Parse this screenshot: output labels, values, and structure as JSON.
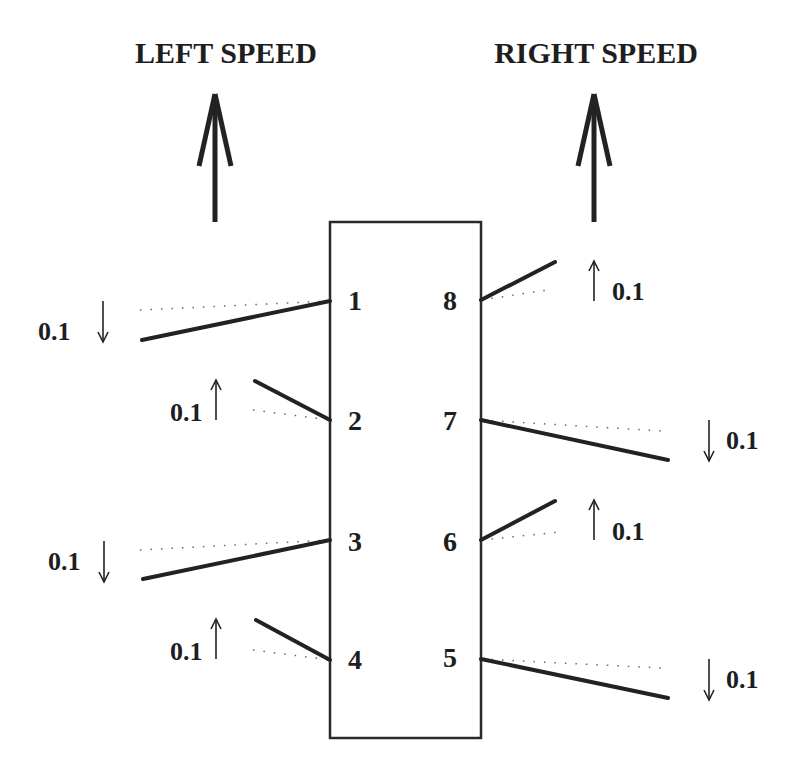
{
  "titles": {
    "left": "LEFT SPEED",
    "right": "RIGHT SPEED"
  },
  "sensors": [
    {
      "id": "1",
      "side": "left",
      "change": "0.1",
      "direction": "down"
    },
    {
      "id": "2",
      "side": "left",
      "change": "0.1",
      "direction": "up"
    },
    {
      "id": "3",
      "side": "left",
      "change": "0.1",
      "direction": "down"
    },
    {
      "id": "4",
      "side": "left",
      "change": "0.1",
      "direction": "up"
    },
    {
      "id": "5",
      "side": "right",
      "change": "0.1",
      "direction": "down"
    },
    {
      "id": "6",
      "side": "right",
      "change": "0.1",
      "direction": "up"
    },
    {
      "id": "7",
      "side": "right",
      "change": "0.1",
      "direction": "down"
    },
    {
      "id": "8",
      "side": "right",
      "change": "0.1",
      "direction": "up"
    }
  ],
  "icons": {
    "speed_arrow": "up-arrow-icon",
    "up": "up-arrow-icon",
    "down": "down-arrow-icon"
  }
}
